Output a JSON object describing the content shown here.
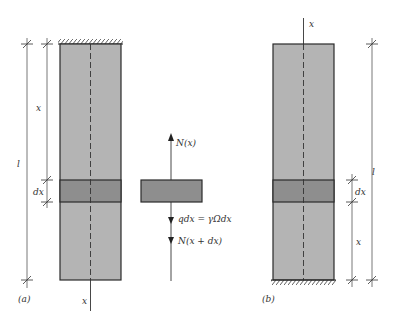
{
  "figure_a": {
    "caption": "(a)",
    "axis_label": "x",
    "dim_x": "x",
    "dim_dx": "dx",
    "dim_l": "l",
    "support": "fixed-top"
  },
  "free_body": {
    "force_top": "N(x)",
    "force_weight": "qdx = γΩdx",
    "force_bottom": "N(x + dx)"
  },
  "figure_b": {
    "caption": "(b)",
    "axis_label": "x",
    "dim_x": "x",
    "dim_dx": "dx",
    "dim_l": "l",
    "support": "fixed-bottom"
  },
  "colors": {
    "bar_fill": "#b4b4b4",
    "band_fill": "#8e8e8e",
    "line": "#2a2a2a"
  }
}
